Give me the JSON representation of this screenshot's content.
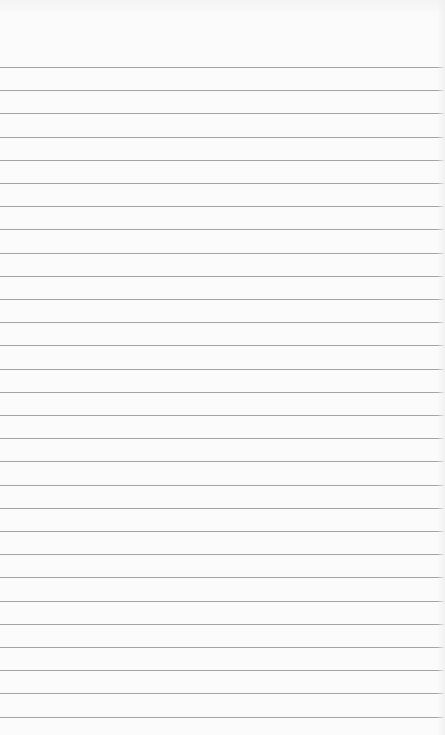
{
  "document": {
    "type": "lined-paper",
    "background_color": "#fbfbfb",
    "line_color": "#9a9a9a",
    "first_line_y": 67,
    "line_spacing": 23.2,
    "line_count": 29,
    "margin_line": false,
    "text_lines": []
  }
}
